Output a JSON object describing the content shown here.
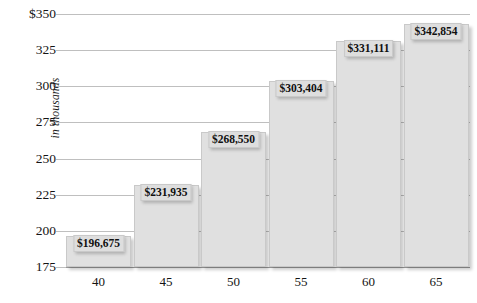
{
  "chart_data": {
    "type": "bar",
    "title": "",
    "subtitle": "",
    "xlabel": "",
    "ylabel": "in thousands",
    "categories": [
      "40",
      "45",
      "50",
      "55",
      "60",
      "65"
    ],
    "values": [
      196675,
      231935,
      268550,
      303404,
      331111,
      342854
    ],
    "value_labels": [
      "$196,675",
      "$231,935",
      "$268,550",
      "$303,404",
      "$331,111",
      "$342,854"
    ],
    "ylim": [
      175000,
      350000
    ],
    "y_ticks": [
      350,
      325,
      300,
      275,
      250,
      225,
      200,
      175
    ],
    "y_tick_labels": [
      "$350",
      "325",
      "300",
      "275",
      "250",
      "225",
      "200",
      "175"
    ],
    "grid": true,
    "legend": false,
    "legend_position": "none",
    "bar_color": "#e0e0e0",
    "bar_border_color": "#c9c9c9",
    "gridline_color": "#bfbfbf",
    "background_color": "#ffffff",
    "text_color": "#141414"
  }
}
